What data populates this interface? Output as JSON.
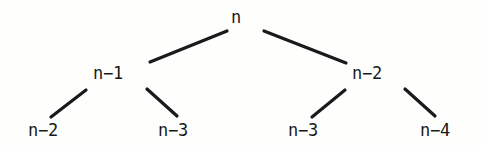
{
  "figure": {
    "name": "recursion-tree",
    "background_color": "#fefefd",
    "edge_color": "#1a1a1c",
    "text_color": "#18181a",
    "width": 482,
    "height": 146
  },
  "tree": {
    "root": {
      "label": "n",
      "x": 236,
      "y": 17
    },
    "level1": [
      {
        "label": "n−1",
        "x": 108,
        "y": 73
      },
      {
        "label": "n−2",
        "x": 367,
        "y": 73
      }
    ],
    "leaves": [
      {
        "label": "n−2",
        "x": 43,
        "y": 130
      },
      {
        "label": "n−3",
        "x": 173,
        "y": 130
      },
      {
        "label": "n−3",
        "x": 303,
        "y": 130
      },
      {
        "label": "n−4",
        "x": 435,
        "y": 130
      }
    ],
    "edges": [
      {
        "name": "edge-root-to-n-1",
        "x1": 227,
        "y1": 31,
        "x2": 150,
        "y2": 62
      },
      {
        "name": "edge-root-to-n-2",
        "x1": 264,
        "y1": 31,
        "x2": 346,
        "y2": 63
      },
      {
        "name": "edge-n-1-to-n-2",
        "x1": 86,
        "y1": 90,
        "x2": 51,
        "y2": 117
      },
      {
        "name": "edge-n-1-to-n-3",
        "x1": 147,
        "y1": 89,
        "x2": 177,
        "y2": 116
      },
      {
        "name": "edge-n-2-to-n-3",
        "x1": 345,
        "y1": 90,
        "x2": 312,
        "y2": 117
      },
      {
        "name": "edge-n-2-to-n-4",
        "x1": 405,
        "y1": 89,
        "x2": 435,
        "y2": 116
      }
    ],
    "edge_width": 3.2
  }
}
